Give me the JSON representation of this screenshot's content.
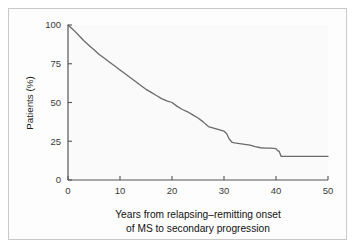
{
  "figure": {
    "border_color": "#c9c9c9",
    "plot_background": "#fbfafa",
    "line_color": "#6a6a6a",
    "axis_color": "#555555"
  },
  "axes": {
    "y_title": "Patients (%)",
    "y_ticks": [
      "0",
      "25",
      "50",
      "75",
      "100"
    ],
    "x_ticks": [
      "0",
      "10",
      "20",
      "30",
      "40",
      "50"
    ],
    "x_caption_line1": "Years from relapsing–remitting onset",
    "x_caption_line2": "of MS to secondary progression"
  },
  "chart_data": {
    "type": "line",
    "title": "",
    "subtitle": "",
    "xlabel": "Years from relapsing–remitting onset of MS to secondary progression",
    "ylabel": "Patients (%)",
    "xlim": [
      0,
      50
    ],
    "ylim": [
      0,
      100
    ],
    "xticks": [
      0,
      10,
      20,
      30,
      40,
      50
    ],
    "yticks": [
      0,
      25,
      50,
      75,
      100
    ],
    "grid": false,
    "legend": false,
    "legend_position": "none",
    "series": [
      {
        "name": "Patients without secondary progression",
        "x": [
          0,
          1,
          2,
          3,
          4,
          5,
          6,
          7,
          8,
          9,
          10,
          11,
          12,
          13,
          14,
          15,
          16,
          17,
          18,
          19,
          20,
          21,
          22,
          23,
          24,
          25,
          26,
          27,
          28,
          29,
          30,
          30.5,
          31,
          31.5,
          32,
          33,
          34,
          35,
          36,
          37,
          38,
          39,
          40,
          40.3,
          40.6,
          41,
          42,
          44,
          46,
          48,
          50
        ],
        "y": [
          100,
          97,
          93.5,
          90,
          87,
          84,
          81,
          78.5,
          76,
          73.5,
          71,
          68.5,
          66,
          63.5,
          61,
          58.5,
          56.5,
          54.5,
          52.5,
          51,
          50,
          47.5,
          45.5,
          44,
          42,
          40,
          37.5,
          34.5,
          33.5,
          32.5,
          31.5,
          30,
          26.5,
          24.5,
          24,
          23.5,
          23,
          22.5,
          21.5,
          20.8,
          20.5,
          20.5,
          20.3,
          19,
          18.5,
          15.2,
          15.2,
          15.2,
          15.2,
          15.2,
          15.2
        ]
      }
    ]
  }
}
